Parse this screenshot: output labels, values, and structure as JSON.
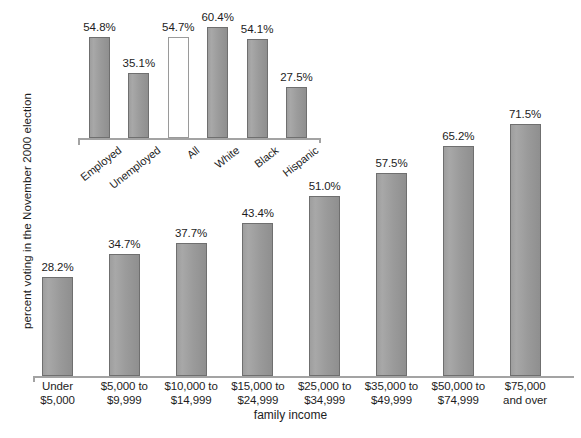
{
  "chart_data": [
    {
      "id": "main",
      "type": "bar",
      "title": "",
      "xlabel": "family income",
      "ylabel": "percent voting in the November 2000 election",
      "categories": [
        "Under\n$5,000",
        "$5,000 to\n$9,999",
        "$10,000 to\n$14,999",
        "$15,000 to\n$24,999",
        "$25,000 to\n$34,999",
        "$35,000 to\n$49,999",
        "$50,000 to\n$74,999",
        "$75,000\nand over"
      ],
      "values": [
        28.2,
        34.7,
        37.7,
        43.4,
        51.0,
        57.5,
        65.2,
        71.5
      ],
      "value_labels": [
        "28.2%",
        "34.7%",
        "37.7%",
        "43.4%",
        "51.0%",
        "57.5%",
        "65.2%",
        "71.5%"
      ],
      "ylim": [
        0,
        71.5
      ],
      "grid": false,
      "legend": "none",
      "bar_fill": "#9b9b9b",
      "bar_stroke": "#6f6f6f"
    },
    {
      "id": "inset",
      "type": "bar",
      "title": "",
      "xlabel": "",
      "ylabel": "",
      "categories": [
        "Employed",
        "Unemployed",
        "All",
        "White",
        "Black",
        "Hispanic"
      ],
      "values": [
        54.8,
        35.1,
        54.7,
        60.4,
        54.1,
        27.5
      ],
      "value_labels": [
        "54.8%",
        "35.1%",
        "54.7%",
        "60.4%",
        "54.1%",
        "27.5%"
      ],
      "highlight_index": 2,
      "highlight_style": "hollow-white",
      "ylim": [
        0,
        60.4
      ],
      "grid": false,
      "legend": "none",
      "bar_fill": "#9b9b9b",
      "bar_stroke": "#6f6f6f"
    }
  ],
  "axes": {
    "main": {
      "y_title": "percent voting in the November 2000 election",
      "x_title": "family income"
    }
  }
}
